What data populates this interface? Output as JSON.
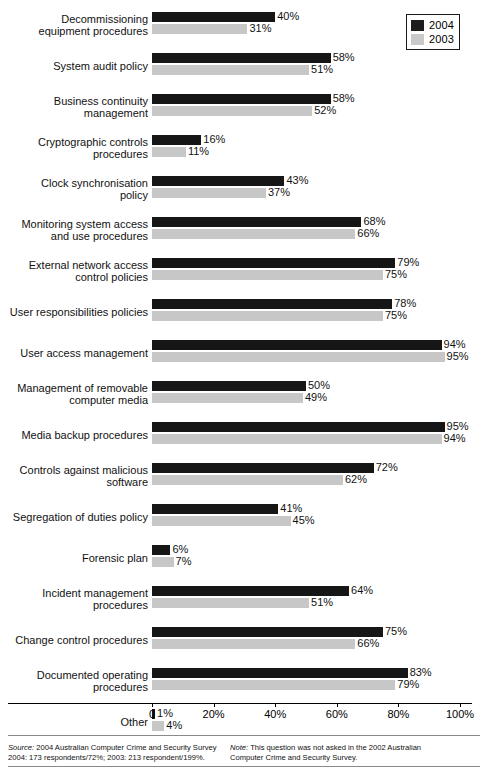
{
  "legend": {
    "items": [
      {
        "label": "2004",
        "color": "#161616",
        "icon": "legend-swatch-icon"
      },
      {
        "label": "2003",
        "color": "#c7c7c7",
        "icon": "legend-swatch-icon"
      }
    ]
  },
  "axis": {
    "ticks": [
      {
        "value": 0,
        "label": "0"
      },
      {
        "value": 20,
        "label": "20%"
      },
      {
        "value": 40,
        "label": "40%"
      },
      {
        "value": 60,
        "label": "60%"
      },
      {
        "value": 80,
        "label": "80%"
      },
      {
        "value": 100,
        "label": "100%"
      }
    ]
  },
  "footer": {
    "source_key": "Source:",
    "source_text": " 2004 Australian Computer Crime and Security Survey",
    "source_line2": "2004: 173 respondents/72%; 2003: 213 respondent/199%.",
    "note_key": "Note:",
    "note_text": " This question was not asked in the 2002 Australian",
    "note_line2": "Computer Crime and Security Survey."
  },
  "chart_data": {
    "type": "bar",
    "title": "",
    "xlabel": "",
    "ylabel": "",
    "xlim": [
      0,
      100
    ],
    "grid": false,
    "legend_position": "top-right",
    "orientation": "horizontal",
    "categories": [
      "Decommissioning\nequipment procedures",
      "System audit policy",
      "Business continuity\nmanagement",
      "Cryptographic controls\nprocedures",
      "Clock synchronisation\npolicy",
      "Monitoring system access\nand use procedures",
      "External network access\ncontrol policies",
      "User responsibilities policies",
      "User access management",
      "Management of removable\ncomputer media",
      "Media backup procedures",
      "Controls against malicious\nsoftware",
      "Segregation of duties policy",
      "Forensic plan",
      "Incident management\nprocedures",
      "Change control procedures",
      "Documented operating\nprocedures",
      "Other"
    ],
    "series": [
      {
        "name": "2004",
        "color": "#161616",
        "values": [
          40,
          58,
          58,
          16,
          43,
          68,
          79,
          78,
          94,
          50,
          95,
          72,
          41,
          6,
          64,
          75,
          83,
          1
        ],
        "labels": [
          "40%",
          "58%",
          "58%",
          "16%",
          "43%",
          "68%",
          "79%",
          "78%",
          "94%",
          "50%",
          "95%",
          "72%",
          "41%",
          "6%",
          "64%",
          "75%",
          "83%",
          "1%"
        ]
      },
      {
        "name": "2003",
        "color": "#c7c7c7",
        "values": [
          31,
          51,
          52,
          11,
          37,
          66,
          75,
          75,
          95,
          49,
          94,
          62,
          45,
          7,
          51,
          66,
          79,
          4
        ],
        "labels": [
          "31%",
          "51%",
          "52%",
          "11%",
          "37%",
          "66%",
          "75%",
          "75%",
          "95%",
          "49%",
          "94%",
          "62%",
          "45%",
          "7%",
          "51%",
          "66%",
          "79%",
          "4%"
        ]
      }
    ]
  }
}
